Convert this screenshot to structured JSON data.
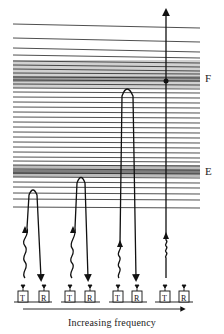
{
  "diagram": {
    "layers": [
      {
        "id": "F",
        "label": "F"
      },
      {
        "id": "E",
        "label": "E"
      }
    ],
    "stations": [
      {
        "transmitter": "T",
        "receiver": "R",
        "path": "reflects below E layer"
      },
      {
        "transmitter": "T",
        "receiver": "R",
        "path": "reflects at E layer"
      },
      {
        "transmitter": "T",
        "receiver": "R",
        "path": "reflects below F layer"
      },
      {
        "transmitter": "T",
        "receiver": "R",
        "path": "penetrates through F layer"
      }
    ],
    "caption": "Increasing frequency",
    "colors": {
      "ink": "#111111",
      "layer_shade": "#9a9a9a",
      "background": "#ffffff"
    }
  }
}
